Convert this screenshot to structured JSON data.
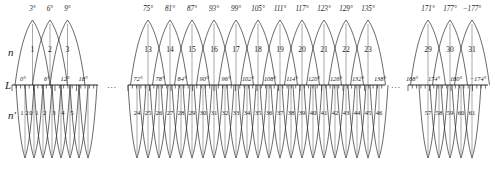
{
  "figure": {
    "row_labels": {
      "upper": "n",
      "axis": "L",
      "lower": "n′"
    },
    "ellipsis": "...",
    "colors": {
      "curve": "#2b2b2b",
      "axis": "#111111",
      "stem": "#6e6e6e",
      "text": "#1a1a1a"
    }
  },
  "chart_data": {
    "type": "diagram",
    "title": "",
    "xlabel": "L",
    "ylabel": "",
    "segments": [
      {
        "id": "left",
        "x_start": 12,
        "x_end": 98,
        "upper": {
          "labels": [
            "3°",
            "6°",
            "9°"
          ],
          "indices": [
            "1",
            "2",
            "3"
          ],
          "lobe_centers": [
            32.5,
            50.0,
            67.5
          ],
          "lobe_half_width": 17.5
        },
        "axis": {
          "labels": [
            "0°",
            "6°",
            "12°",
            "18°"
          ],
          "label_x": [
            23,
            47,
            65,
            83
          ],
          "tick_count": 20,
          "tick_spacing": 4.3
        },
        "lower": {
          "indices": [
            "1",
            "2",
            "0",
            "1",
            "2",
            "3",
            "4",
            "5"
          ],
          "label_x": [
            22,
            27,
            31,
            37,
            45,
            54,
            63,
            72
          ],
          "lobe_centers": [
            25,
            34,
            43,
            52,
            61,
            70,
            79,
            88
          ],
          "lobe_half_width": 9
        }
      },
      {
        "id": "middle",
        "x_start": 128,
        "x_end": 385,
        "upper": {
          "labels": [
            "75°",
            "81°",
            "87°",
            "93°",
            "99°",
            "105°",
            "111°",
            "117°",
            "123°",
            "129°",
            "135°"
          ],
          "indices": [
            "13",
            "14",
            "15",
            "16",
            "17",
            "18",
            "19",
            "20",
            "21",
            "22",
            "23"
          ],
          "lobe_centers": [
            148,
            170,
            192,
            214,
            236,
            258,
            280,
            302,
            324,
            346,
            368
          ],
          "lobe_half_width": 17.5
        },
        "axis": {
          "labels": [
            "72°",
            "78°",
            "84°",
            "90°",
            "96°",
            "102°",
            "108°",
            "114°",
            "120°",
            "126°",
            "132°",
            "138°"
          ],
          "label_x": [
            138,
            160,
            182,
            204,
            226,
            248,
            270,
            292,
            314,
            336,
            358,
            380
          ],
          "tick_count": 60,
          "tick_spacing": 4.3
        },
        "lower": {
          "indices": [
            "24",
            "25",
            "26",
            "27",
            "28",
            "29",
            "30",
            "31",
            "32",
            "33",
            "34",
            "35",
            "36",
            "37",
            "38",
            "39",
            "40",
            "41",
            "42",
            "43",
            "44",
            "45",
            "46"
          ],
          "label_x": [
            137,
            148,
            159,
            170,
            181,
            192,
            203,
            214,
            225,
            236,
            247,
            258,
            269,
            280,
            291,
            302,
            313,
            324,
            335,
            346,
            357,
            368,
            379
          ],
          "lobe_centers": [
            137,
            148,
            159,
            170,
            181,
            192,
            203,
            214,
            225,
            236,
            247,
            258,
            269,
            280,
            291,
            302,
            313,
            324,
            335,
            346,
            357,
            368,
            379
          ],
          "lobe_half_width": 9
        }
      },
      {
        "id": "right",
        "x_start": 408,
        "x_end": 488,
        "upper": {
          "labels": [
            "171°",
            "177°",
            "−177°"
          ],
          "indices": [
            "29",
            "30",
            "31"
          ],
          "lobe_centers": [
            428,
            450,
            472
          ],
          "lobe_half_width": 17.5
        },
        "axis": {
          "labels": [
            "168°",
            "174°",
            "180°",
            "−174°"
          ],
          "label_x": [
            412,
            434,
            456,
            478
          ],
          "tick_count": 19,
          "tick_spacing": 4.3
        },
        "lower": {
          "indices": [
            "57",
            "58",
            "59",
            "60",
            "61"
          ],
          "label_x": [
            428,
            439,
            450,
            461,
            472
          ],
          "lobe_centers": [
            428,
            439,
            450,
            461,
            472
          ],
          "lobe_half_width": 9
        }
      }
    ],
    "ellipsis_positions": [
      {
        "x": 112,
        "y": 88
      },
      {
        "x": 396,
        "y": 88
      }
    ],
    "geometry": {
      "axis_y": 85,
      "upper_apex_y": 20,
      "lower_apex_y": 158,
      "n_label_y": 52,
      "np_label_y": 115,
      "top_label_y": 11,
      "axis_label_y": 81
    }
  }
}
